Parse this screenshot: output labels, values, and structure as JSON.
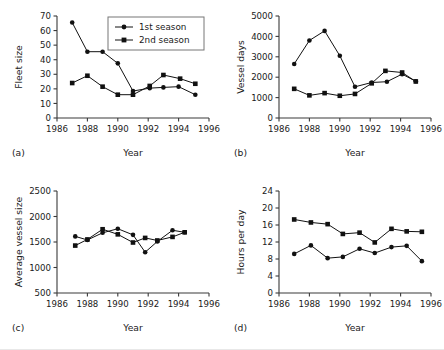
{
  "figure": {
    "panels": [
      "a",
      "b",
      "c",
      "d"
    ],
    "legend": {
      "title": "",
      "entries": [
        {
          "label": "1st season",
          "marker": "circle"
        },
        {
          "label": "2nd season",
          "marker": "square"
        }
      ]
    },
    "shared_xlabel": "Year",
    "colors": {
      "ink": "#111111",
      "axis": "#3a3a3a",
      "background": "#ffffff"
    }
  },
  "chart_data": [
    {
      "type": "line",
      "panel": "a",
      "title": "",
      "xlabel": "Year",
      "ylabel": "Fleet size",
      "xlim": [
        1986,
        1996
      ],
      "ylim": [
        0,
        70
      ],
      "xticks": [
        1986,
        1988,
        1990,
        1992,
        1994,
        1996
      ],
      "yticks": [
        0,
        10,
        20,
        30,
        40,
        50,
        60,
        70
      ],
      "grid": false,
      "legend_position": "top-right",
      "series": [
        {
          "name": "1st season",
          "marker": "circle",
          "x": [
            1987.0,
            1988.0,
            1989.0,
            1990.0,
            1991.0,
            1992.1,
            1993.0,
            1994.0,
            1995.1
          ],
          "values": [
            65.5,
            45.5,
            45.5,
            37.5,
            18.5,
            20.5,
            21.0,
            21.5,
            16.0
          ]
        },
        {
          "name": "2nd season",
          "marker": "square",
          "x": [
            1987.0,
            1988.0,
            1989.0,
            1990.0,
            1991.0,
            1992.1,
            1993.0,
            1994.1,
            1995.1
          ],
          "values": [
            24.0,
            29.0,
            21.5,
            16.0,
            16.0,
            22.0,
            29.5,
            27.0,
            23.5
          ]
        }
      ]
    },
    {
      "type": "line",
      "panel": "b",
      "title": "",
      "xlabel": "Year",
      "ylabel": "Vessel days",
      "xlim": [
        1986,
        1996
      ],
      "ylim": [
        0,
        5000
      ],
      "xticks": [
        1986,
        1988,
        1990,
        1992,
        1994,
        1996
      ],
      "yticks": [
        0,
        1000,
        2000,
        3000,
        4000,
        5000
      ],
      "grid": false,
      "legend_position": "none",
      "series": [
        {
          "name": "1st season",
          "marker": "circle",
          "x": [
            1987.0,
            1988.0,
            1989.0,
            1990.0,
            1991.0,
            1992.1,
            1993.1,
            1994.1,
            1995.0
          ],
          "values": [
            2650,
            3800,
            4270,
            3050,
            1530,
            1740,
            1780,
            2150,
            1800
          ]
        },
        {
          "name": "2nd season",
          "marker": "square",
          "x": [
            1987.0,
            1988.0,
            1989.0,
            1990.0,
            1991.0,
            1992.1,
            1993.0,
            1994.1,
            1995.0
          ],
          "values": [
            1430,
            1110,
            1220,
            1090,
            1180,
            1700,
            2310,
            2230,
            1790
          ]
        }
      ]
    },
    {
      "type": "line",
      "panel": "c",
      "title": "",
      "xlabel": "Year",
      "ylabel": "Average vessel size",
      "xlim": [
        1986,
        1996
      ],
      "ylim": [
        500,
        2500
      ],
      "xticks": [
        1986,
        1988,
        1990,
        1992,
        1994,
        1996
      ],
      "yticks": [
        500,
        1000,
        1500,
        2000,
        2500
      ],
      "grid": false,
      "legend_position": "none",
      "series": [
        {
          "name": "1st season",
          "marker": "circle",
          "x": [
            1987.2,
            1988.0,
            1989.0,
            1990.0,
            1991.0,
            1991.8,
            1992.6,
            1993.6,
            1994.4
          ],
          "values": [
            1610,
            1540,
            1680,
            1760,
            1640,
            1300,
            1510,
            1730,
            1690
          ]
        },
        {
          "name": "2nd season",
          "marker": "square",
          "x": [
            1987.2,
            1988.0,
            1989.0,
            1990.0,
            1991.0,
            1991.8,
            1992.6,
            1993.6,
            1994.4
          ],
          "values": [
            1430,
            1550,
            1750,
            1650,
            1490,
            1580,
            1530,
            1600,
            1690
          ]
        }
      ]
    },
    {
      "type": "line",
      "panel": "d",
      "title": "",
      "xlabel": "Year",
      "ylabel": "Hours per day",
      "xlim": [
        1986,
        1996
      ],
      "ylim": [
        0,
        24
      ],
      "xticks": [
        1986,
        1988,
        1990,
        1992,
        1994,
        1996
      ],
      "yticks": [
        0,
        4,
        8,
        12,
        16,
        20,
        24
      ],
      "grid": false,
      "legend_position": "none",
      "series": [
        {
          "name": "1st season",
          "marker": "circle",
          "x": [
            1987.0,
            1988.1,
            1989.2,
            1990.2,
            1991.3,
            1992.3,
            1993.4,
            1994.4,
            1995.4
          ],
          "values": [
            9.2,
            11.2,
            8.2,
            8.5,
            10.4,
            9.4,
            10.8,
            11.1,
            7.5
          ]
        },
        {
          "name": "2nd season",
          "marker": "square",
          "x": [
            1987.0,
            1988.1,
            1989.2,
            1990.2,
            1991.3,
            1992.3,
            1993.4,
            1994.4,
            1995.4
          ],
          "values": [
            17.3,
            16.6,
            16.2,
            13.9,
            14.2,
            11.9,
            15.1,
            14.5,
            14.4
          ]
        }
      ]
    }
  ]
}
